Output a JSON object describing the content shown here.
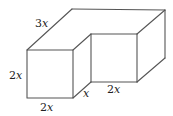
{
  "figure": {
    "type": "L-shaped rectangular solid (isometric view)",
    "labels": {
      "top_depth": {
        "coef": "3",
        "var": "x"
      },
      "front_height": {
        "coef": "2",
        "var": "x"
      },
      "front_width": {
        "coef": "2",
        "var": "x"
      },
      "inner_depth": {
        "coef": "",
        "var": "x"
      },
      "inner_width": {
        "coef": "2",
        "var": "x"
      }
    },
    "colors": {
      "edge": "#555555",
      "text": "#222222",
      "background": "#ffffff"
    }
  }
}
